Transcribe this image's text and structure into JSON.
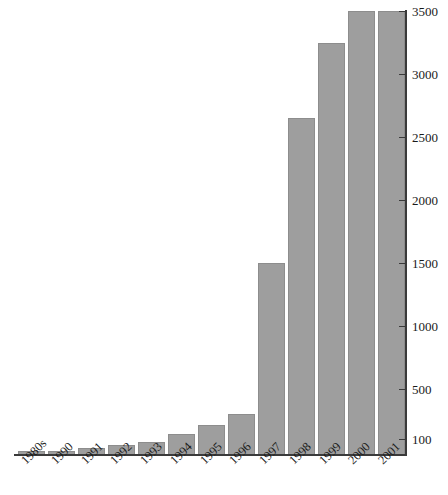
{
  "chart_data": {
    "type": "bar",
    "title": "",
    "subtitle": "",
    "xlabel": "",
    "ylabel": "",
    "categories": [
      "1980s",
      "1990",
      "1991",
      "1992",
      "1993",
      "1994",
      "1995",
      "1996",
      "1997",
      "1998",
      "1999",
      "2000",
      "2001"
    ],
    "values": [
      10,
      12,
      30,
      55,
      80,
      140,
      215,
      300,
      1500,
      2650,
      3250,
      3500,
      3500
    ],
    "series": [
      {
        "name": "count",
        "values": [
          10,
          12,
          30,
          55,
          80,
          140,
          215,
          300,
          1500,
          2650,
          3250,
          3500,
          3500
        ]
      }
    ],
    "ytick_labels": [
      "100",
      "500",
      "1000",
      "1500",
      "2000",
      "2500",
      "3000",
      "3500"
    ],
    "ytick_values": [
      100,
      500,
      1000,
      1500,
      2000,
      2500,
      3000,
      3500
    ],
    "ylim": [
      0,
      3500
    ],
    "grid": false,
    "legend": false,
    "legend_position": "none",
    "bar_color": "#9e9e9e",
    "axis_color": "#3a3a3a",
    "text_color": "#1a1a1a",
    "y_axis_side": "right",
    "xtick_rotation": -45
  }
}
